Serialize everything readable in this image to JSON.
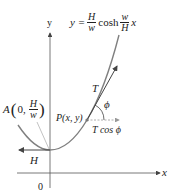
{
  "diagram": {
    "equation": {
      "lhs": "y =",
      "frac1_num": "H",
      "frac1_den": "w",
      "func": "cosh",
      "frac2_num": "w",
      "frac2_den": "H",
      "var": "x"
    },
    "axes": {
      "x_label": "x",
      "y_label": "y",
      "origin_label": "0"
    },
    "point_A": {
      "prefix": "A",
      "open": "(",
      "coord": "0,",
      "frac_num": "H",
      "frac_den": "w",
      "close": ")"
    },
    "point_P": "P(x, y)",
    "tension_label": "T",
    "angle_label": "ϕ",
    "horizontal_component_label": "T cos ϕ",
    "H_label": "H",
    "colors": {
      "curve": "#808080",
      "axis": "#555555",
      "text": "#222222",
      "component": "#a0a0a0"
    }
  }
}
